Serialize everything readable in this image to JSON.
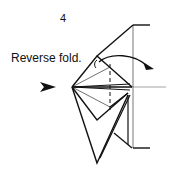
{
  "diagram": {
    "step_number": "4",
    "instruction": "Reverse fold.",
    "icons": [
      "push-arrow-icon",
      "fold-direction-arrow-icon"
    ],
    "colors": {
      "line": "#111111",
      "background": "#ffffff"
    }
  }
}
